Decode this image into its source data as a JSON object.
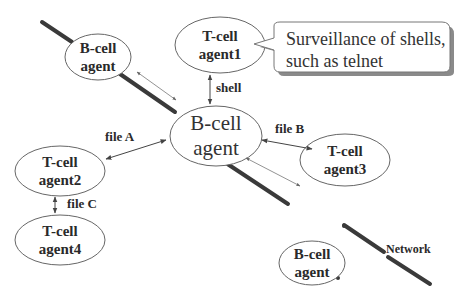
{
  "diagram": {
    "network_label": "Network",
    "callout": {
      "line1": "Surveillance of shells,",
      "line2": "such as telnet"
    },
    "nodes": {
      "bcell_top": {
        "line1": "B-cell",
        "line2": "agent"
      },
      "tcell_agent1": {
        "line1": "T-cell",
        "line2": "agent1"
      },
      "bcell_center": {
        "line1": "B-cell",
        "line2": "agent"
      },
      "tcell_agent3": {
        "line1": "T-cell",
        "line2": "agent3"
      },
      "tcell_agent2": {
        "line1": "T-cell",
        "line2": "agent2"
      },
      "tcell_agent4": {
        "line1": "T-cell",
        "line2": "agent4"
      },
      "bcell_bottom": {
        "line1": "B-cell",
        "line2": "agent"
      }
    },
    "edges": {
      "shell": "shell",
      "file_a": "file A",
      "file_b": "file B",
      "file_c": "file C"
    },
    "colors": {
      "network_line": "#3a3a3a",
      "ellipse_stroke": "#555555",
      "arrow": "#444444",
      "callout_shadow": "#8a8a8a"
    }
  }
}
